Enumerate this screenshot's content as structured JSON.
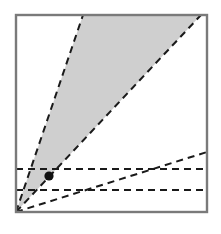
{
  "figure": {
    "title": "Shaded cone region diagram",
    "canvas": {
      "width": 221,
      "height": 234
    },
    "frame": {
      "label": "plot frame",
      "x": 16,
      "y": 15,
      "width": 191,
      "height": 197,
      "stroke": "#7a7a7a",
      "stroke_width": 2.4,
      "fill": "#ffffff"
    },
    "origin": {
      "label": "origin",
      "x": 16,
      "y": 212
    },
    "shaded_region": {
      "label": "shaded cone",
      "fill": "#cfcfcf",
      "opacity": 1,
      "points": "16,212 83,15 201,15 16,212"
    },
    "rays": [
      {
        "name": "cone-left-boundary",
        "label": "steep dashed ray (left cone edge)",
        "x1": 16,
        "y1": 212,
        "x2": 83,
        "y2": 15,
        "stroke": "#1a1a1a",
        "stroke_width": 2,
        "dash": "7,5"
      },
      {
        "name": "cone-right-boundary",
        "label": "dashed ray (right cone edge)",
        "x1": 16,
        "y1": 212,
        "x2": 201,
        "y2": 15,
        "stroke": "#1a1a1a",
        "stroke_width": 2,
        "dash": "7,5"
      },
      {
        "name": "shallow-ray",
        "label": "shallow dashed ray",
        "x1": 16,
        "y1": 212,
        "x2": 207,
        "y2": 152,
        "stroke": "#1a1a1a",
        "stroke_width": 2,
        "dash": "7,5"
      }
    ],
    "horizontal_lines": [
      {
        "name": "upper-horizontal",
        "label": "upper horizontal dashed line",
        "y": 169,
        "x1": 16,
        "x2": 207,
        "stroke": "#1a1a1a",
        "stroke_width": 2,
        "dash": "7,5"
      },
      {
        "name": "lower-horizontal",
        "label": "lower horizontal dashed line",
        "y": 190,
        "x1": 16,
        "x2": 207,
        "stroke": "#1a1a1a",
        "stroke_width": 2,
        "dash": "7,5"
      }
    ],
    "points": [
      {
        "name": "marked-point",
        "label": "marked point",
        "x": 49,
        "y": 176,
        "radius": 4.6,
        "fill": "#111111"
      }
    ]
  }
}
